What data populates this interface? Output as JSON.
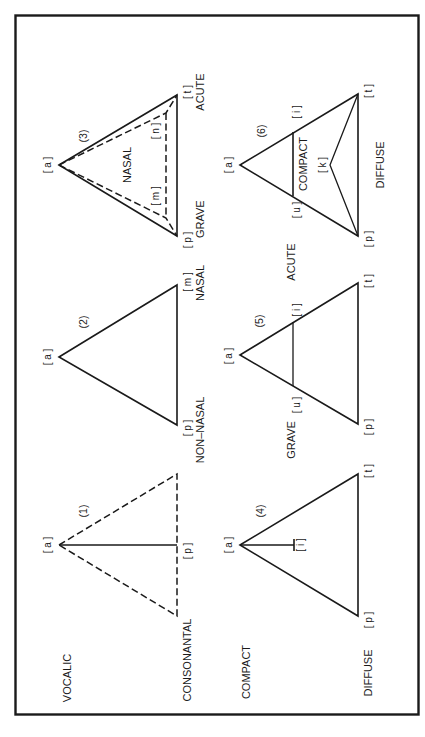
{
  "figure": {
    "orientation": "rotated 90 degrees (text reads bottom-to-top)",
    "border": true,
    "panels": [
      {
        "id": "1",
        "number_label": "(1)",
        "vertex_labels": {
          "apex": "[ a ]",
          "base_center": "[ p ]"
        },
        "axis_labels": {
          "top": "VOCALIC",
          "bottom": "CONSONANTAL"
        },
        "style": "dashed triangle with solid line from [a] to [p]"
      },
      {
        "id": "2",
        "number_label": "(2)",
        "vertex_labels": {
          "apex": "[ a ]",
          "left": "[ p ]",
          "right": "[ m ]"
        },
        "axis_labels": {
          "left": "NON–NASAL",
          "right": "NASAL"
        },
        "style": "solid triangle"
      },
      {
        "id": "3",
        "number_label": "(3)",
        "vertex_labels": {
          "apex": "[ a ]",
          "left": "[ p ]",
          "right": "[ t ]",
          "inner_left": "[ m ]",
          "inner_right": "[ n ]"
        },
        "inner_label": "NASAL",
        "axis_labels": {
          "left": "GRAVE",
          "right": "ACUTE"
        },
        "style": "solid triangle with inner dashed nasal triangle"
      },
      {
        "id": "4",
        "number_label": "(4)",
        "vertex_labels": {
          "apex": "[ a ]",
          "left": "[ p ]",
          "right": "[ t ]",
          "inner": "[ i ]"
        },
        "axis_labels": {
          "top": "COMPACT",
          "bottom": "DIFFUSE"
        },
        "style": "solid triangle with short stem from [a] to [i]"
      },
      {
        "id": "5",
        "number_label": "(5)",
        "vertex_labels": {
          "apex": "[ a ]",
          "left": "[ p ]",
          "right": "[ t ]",
          "mid_left": "[ u ]",
          "mid_right": "[ i ]"
        },
        "axis_labels": {
          "left": "GRAVE",
          "right": "ACUTE"
        },
        "style": "solid triangle with horizontal line [u]–[i]"
      },
      {
        "id": "6",
        "number_label": "(6)",
        "vertex_labels": {
          "apex": "[ a ]",
          "left": "[ p ]",
          "right": "[ t ]",
          "mid_left": "[ u ]",
          "mid_right": "[ i ]",
          "inner": "[ k ]"
        },
        "inner_label": "COMPACT",
        "axis_labels": {
          "bottom": "DIFFUSE"
        },
        "style": "solid triangle with [u]–[i] line and [p]–[k]–[t] chevron"
      }
    ]
  },
  "text": {
    "p1_num": "(1)",
    "p1_a": "[ a ]",
    "p1_p": "[ p ]",
    "p1_vocalic": "VOCALIC",
    "p1_consonantal": "CONSONANTAL",
    "p2_num": "(2)",
    "p2_a": "[ a ]",
    "p2_p": "[ p ]",
    "p2_m": "[ m ]",
    "p2_nonnasal": "NON–NASAL",
    "p2_nasal": "NASAL",
    "p3_num": "(3)",
    "p3_a": "[ a ]",
    "p3_p": "[ p ]",
    "p3_t": "[ t ]",
    "p3_m": "[ m ]",
    "p3_n": "[ n ]",
    "p3_nasal": "NASAL",
    "p3_grave": "GRAVE",
    "p3_acute": "ACUTE",
    "p4_num": "(4)",
    "p4_a": "[ a ]",
    "p4_p": "[ p ]",
    "p4_t": "[ t ]",
    "p4_i": "[ i ]",
    "p4_compact": "COMPACT",
    "p4_diffuse": "DIFFUSE",
    "p5_num": "(5)",
    "p5_a": "[ a ]",
    "p5_p": "[ p ]",
    "p5_t": "[ t ]",
    "p5_u": "[ u ]",
    "p5_i": "[ i ]",
    "p5_grave": "GRAVE",
    "p5_acute": "ACUTE",
    "p6_num": "(6)",
    "p6_a": "[ a ]",
    "p6_p": "[ p ]",
    "p6_t": "[ t ]",
    "p6_u": "[ u ]",
    "p6_i": "[ i ]",
    "p6_k": "[ k ]",
    "p6_compact": "COMPACT",
    "p6_diffuse": "DIFFUSE"
  },
  "colors": {
    "ink": "#1a1a1a",
    "background": "#ffffff"
  }
}
